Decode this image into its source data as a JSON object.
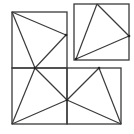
{
  "diagram": {
    "width": 134,
    "height": 134,
    "stroke_color": "#3a3a3a",
    "background": "#ffffff",
    "rectangles": [
      {
        "name": "left-tall-rect-top",
        "x": 12,
        "y": 12,
        "w": 55,
        "h": 56
      },
      {
        "name": "left-tall-rect-bottom",
        "x": 12,
        "y": 68,
        "w": 55,
        "h": 56
      },
      {
        "name": "bottom-right-rect",
        "x": 67,
        "y": 68,
        "w": 54,
        "h": 56
      },
      {
        "name": "small-top-right-square",
        "x": 74,
        "y": 4,
        "w": 55,
        "h": 56
      }
    ],
    "segments": [
      {
        "name": "seg-topleft-to-rightmid",
        "x1": 12,
        "y1": 12,
        "x2": 66,
        "y2": 35
      },
      {
        "name": "seg-rightmid-to-crossing",
        "x1": 66,
        "y1": 35,
        "x2": 35,
        "y2": 68
      },
      {
        "name": "seg-topleft-to-crossing",
        "x1": 12,
        "y1": 12,
        "x2": 35,
        "y2": 68
      },
      {
        "name": "seg-crossing-to-center",
        "x1": 35,
        "y1": 68,
        "x2": 67,
        "y2": 100
      },
      {
        "name": "seg-crossing-to-bottomleft",
        "x1": 35,
        "y1": 68,
        "x2": 12,
        "y2": 124
      },
      {
        "name": "seg-bottomleft-to-center",
        "x1": 12,
        "y1": 124,
        "x2": 67,
        "y2": 100
      },
      {
        "name": "seg-center-to-topmid",
        "x1": 67,
        "y1": 100,
        "x2": 99,
        "y2": 68
      },
      {
        "name": "seg-topmid-to-bottomright",
        "x1": 99,
        "y1": 68,
        "x2": 121,
        "y2": 124
      },
      {
        "name": "seg-center-to-bottomright",
        "x1": 67,
        "y1": 100,
        "x2": 121,
        "y2": 124
      },
      {
        "name": "seg-small-top-to-right",
        "x1": 97,
        "y1": 4,
        "x2": 129,
        "y2": 36
      },
      {
        "name": "seg-small-top-to-bottomleft",
        "x1": 97,
        "y1": 4,
        "x2": 76,
        "y2": 59
      },
      {
        "name": "seg-small-bottomleft-to-right",
        "x1": 76,
        "y1": 59,
        "x2": 129,
        "y2": 36
      }
    ],
    "points": [
      {
        "name": "point-rightmid",
        "x": 66,
        "y": 35
      },
      {
        "name": "point-crossing",
        "x": 35,
        "y": 68
      },
      {
        "name": "point-center",
        "x": 67,
        "y": 100
      },
      {
        "name": "point-topmid",
        "x": 99,
        "y": 68
      },
      {
        "name": "point-small-bottomleft",
        "x": 76,
        "y": 59
      },
      {
        "name": "point-small-right",
        "x": 129,
        "y": 36
      }
    ]
  }
}
